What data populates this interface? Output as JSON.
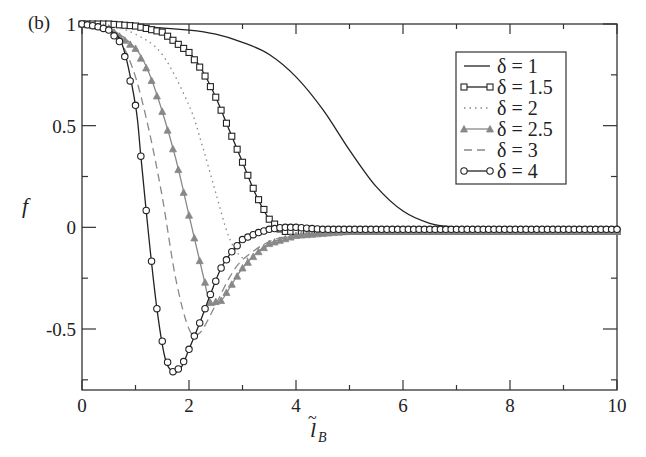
{
  "panel_label": "(b)",
  "chart_data": {
    "type": "line",
    "title": "",
    "xlabel": "l̃_B",
    "ylabel": "f",
    "xlim": [
      0,
      10
    ],
    "ylim": [
      -0.8,
      1
    ],
    "xticks": [
      0,
      2,
      4,
      6,
      8,
      10
    ],
    "xtick_labels": [
      "0",
      "2",
      "4",
      "6",
      "8",
      "10"
    ],
    "yticks": [
      1,
      0.5,
      0,
      -0.5
    ],
    "ytick_labels": [
      "1",
      "0.5",
      "0",
      "-0.5"
    ],
    "grid": false,
    "legend_position": "upper right",
    "series": [
      {
        "name": "δ = 1",
        "style": "solid",
        "marker": "none",
        "color": "#222222",
        "x": [
          0,
          1,
          2,
          2.5,
          3,
          3.5,
          4,
          4.5,
          5,
          5.5,
          6,
          6.5,
          7,
          7.5,
          8,
          9,
          10
        ],
        "y": [
          1,
          0.99,
          0.97,
          0.95,
          0.91,
          0.85,
          0.74,
          0.58,
          0.38,
          0.2,
          0.08,
          0.02,
          0.0,
          -0.01,
          -0.02,
          -0.02,
          -0.02
        ]
      },
      {
        "name": "δ = 1.5",
        "style": "solid",
        "marker": "square",
        "color": "#222222",
        "x": [
          0,
          0.5,
          1,
          1.5,
          2,
          2.25,
          2.5,
          2.75,
          3,
          3.25,
          3.5,
          3.75,
          4,
          5,
          6,
          7,
          8,
          9,
          10
        ],
        "y": [
          1,
          1,
          0.99,
          0.96,
          0.86,
          0.77,
          0.64,
          0.48,
          0.32,
          0.16,
          0.04,
          -0.02,
          -0.02,
          -0.02,
          -0.02,
          -0.02,
          -0.02,
          -0.02,
          -0.02
        ]
      },
      {
        "name": "δ = 2",
        "style": "dotted",
        "marker": "none",
        "color": "#888888",
        "x": [
          0,
          0.5,
          1,
          1.5,
          2,
          2.25,
          2.5,
          2.75,
          3,
          3.25,
          3.5,
          4,
          4.5,
          5,
          6,
          8,
          10
        ],
        "y": [
          1,
          0.99,
          0.95,
          0.85,
          0.6,
          0.4,
          0.17,
          -0.05,
          -0.15,
          -0.13,
          -0.09,
          -0.05,
          -0.03,
          -0.02,
          -0.02,
          -0.02,
          -0.02
        ]
      },
      {
        "name": "δ = 2.5",
        "style": "solid",
        "marker": "triangle",
        "color": "#888888",
        "x": [
          0,
          0.5,
          1,
          1.25,
          1.5,
          1.75,
          2,
          2.25,
          2.4,
          2.6,
          2.8,
          3,
          3.25,
          3.5,
          4,
          4.5,
          5,
          6,
          8,
          10
        ],
        "y": [
          1,
          0.98,
          0.88,
          0.76,
          0.57,
          0.34,
          0.06,
          -0.22,
          -0.37,
          -0.36,
          -0.28,
          -0.2,
          -0.13,
          -0.08,
          -0.04,
          -0.03,
          -0.02,
          -0.02,
          -0.02,
          -0.02
        ]
      },
      {
        "name": "δ = 3",
        "style": "dashed",
        "marker": "none",
        "color": "#888888",
        "x": [
          0,
          0.5,
          0.75,
          1,
          1.25,
          1.5,
          1.75,
          2,
          2.2,
          2.5,
          2.75,
          3,
          3.5,
          4,
          5,
          6,
          8,
          10
        ],
        "y": [
          1,
          0.97,
          0.9,
          0.74,
          0.48,
          0.15,
          -0.25,
          -0.5,
          -0.52,
          -0.38,
          -0.25,
          -0.16,
          -0.07,
          -0.04,
          -0.02,
          -0.02,
          -0.02,
          -0.02
        ]
      },
      {
        "name": "δ = 4",
        "style": "solid",
        "marker": "circle",
        "color": "#222222",
        "x": [
          0,
          0.25,
          0.5,
          0.75,
          1,
          1.1,
          1.25,
          1.4,
          1.55,
          1.7,
          1.85,
          2,
          2.2,
          2.4,
          2.6,
          2.8,
          3,
          3.25,
          3.5,
          3.75,
          4,
          4.5,
          5,
          6,
          8,
          10
        ],
        "y": [
          1,
          0.99,
          0.97,
          0.9,
          0.6,
          0.35,
          -0.05,
          -0.4,
          -0.64,
          -0.71,
          -0.69,
          -0.6,
          -0.47,
          -0.33,
          -0.2,
          -0.12,
          -0.06,
          -0.03,
          -0.01,
          0.0,
          0.0,
          -0.01,
          -0.01,
          -0.01,
          -0.01,
          -0.01
        ]
      }
    ]
  },
  "legend": {
    "entries": [
      "δ  = 1",
      "δ  = 1.5",
      "δ  = 2",
      "δ  = 2.5",
      "δ  = 3",
      "δ  = 4"
    ]
  },
  "axes": {
    "ylabel": "f",
    "xlabel_main": "l",
    "xlabel_sub": "B",
    "xlabel_tilde": "~"
  }
}
